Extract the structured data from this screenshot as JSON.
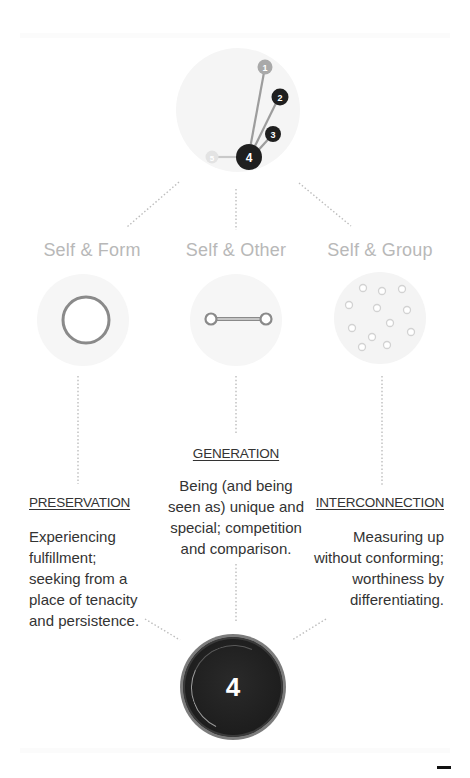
{
  "top_diagram": {
    "nodes": [
      {
        "label": "1",
        "color": "#a9a9a9"
      },
      {
        "label": "2",
        "color": "#1f1f1f"
      },
      {
        "label": "3",
        "color": "#1f1f1f"
      },
      {
        "label": "4",
        "color": "#1f1f1f",
        "active": true
      },
      {
        "label": "5",
        "color": "#e3e3e3"
      }
    ]
  },
  "groups": [
    {
      "label": "Self & Form",
      "icon": "single-ring-icon"
    },
    {
      "label": "Self & Other",
      "icon": "linked-pair-icon"
    },
    {
      "label": "Self & Group",
      "icon": "scattered-dots-icon"
    }
  ],
  "stages": [
    {
      "title": "PRESERVATION",
      "description_lines": [
        "Experiencing",
        "fulfillment;",
        "seeking from a",
        "place of tenacity",
        "and persistence."
      ]
    },
    {
      "title": "GENERATION",
      "description_lines": [
        "Being (and being",
        "seen as) unique and",
        "special; competition",
        "and comparison."
      ]
    },
    {
      "title": "INTERCONNECTION",
      "description_lines": [
        "Measuring up",
        "without conforming;",
        "worthiness by",
        "differentiating."
      ]
    }
  ],
  "result_badge": {
    "label": "4"
  },
  "colors": {
    "label_gray": "#b8b8b8",
    "text_dark": "#333333",
    "dot_gray": "#bdbdbd",
    "badge_dark": "#1d1d1d"
  }
}
